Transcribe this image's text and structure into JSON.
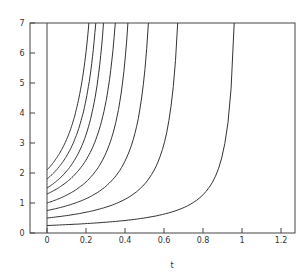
{
  "chart_data": {
    "type": "line",
    "title": "",
    "xlabel": "t",
    "ylabel": "",
    "xlim": [
      -0.08,
      1.27
    ],
    "ylim": [
      0,
      7
    ],
    "xticks": [
      "0",
      "0.2",
      "0.4",
      "0.6",
      "0.8",
      "1",
      "1.2"
    ],
    "yticks": [
      "0",
      "1",
      "2",
      "3",
      "4",
      "5",
      "6",
      "7"
    ],
    "grid": false,
    "legend": null,
    "series": [
      {
        "name": "y0=0.25",
        "y0": 0.25,
        "t_reach_top": 0.96
      },
      {
        "name": "y0=0.5",
        "y0": 0.5,
        "t_reach_top": 0.67
      },
      {
        "name": "y0=0.75",
        "y0": 0.75,
        "t_reach_top": 0.52
      },
      {
        "name": "y0=1.0",
        "y0": 1.0,
        "t_reach_top": 0.415
      },
      {
        "name": "y0=1.3",
        "y0": 1.3,
        "t_reach_top": 0.35
      },
      {
        "name": "y0=1.5",
        "y0": 1.5,
        "t_reach_top": 0.29
      },
      {
        "name": "y0=1.8",
        "y0": 1.8,
        "t_reach_top": 0.25
      },
      {
        "name": "y0=2.1",
        "y0": 2.1,
        "t_reach_top": 0.215
      }
    ],
    "vertical_line_at_t": 0
  }
}
